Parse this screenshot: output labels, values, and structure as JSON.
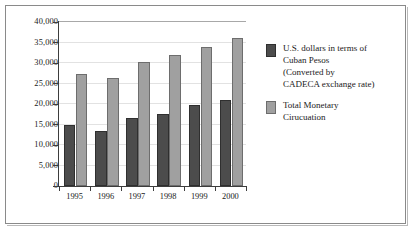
{
  "chart_data": {
    "type": "bar",
    "title": "",
    "subtitle": "",
    "xlabel": "",
    "ylabel": "",
    "categories": [
      "1995",
      "1996",
      "1997",
      "1998",
      "1999",
      "2000"
    ],
    "series": [
      {
        "name": "U.S. dollars in terms of Cuban Pesos (Converted by CADECA exchange rate)",
        "color": "#4c4c4c",
        "values": [
          14800,
          13300,
          16700,
          17600,
          19700,
          21000
        ]
      },
      {
        "name": "Total Monetary Cirucuation",
        "color": "#a0a0a0",
        "values": [
          27300,
          26400,
          30300,
          32000,
          33900,
          36200
        ]
      }
    ],
    "ylim": [
      0,
      40000
    ],
    "ytick_values": [
      0,
      5000,
      10000,
      15000,
      20000,
      25000,
      30000,
      35000,
      40000
    ],
    "ytick_labels": [
      "0",
      "5,000",
      "10,000",
      "15,000",
      "20,000",
      "25,000",
      "30,000",
      "35,000",
      "40,000"
    ],
    "grid": true,
    "legend_position": "right"
  },
  "legend": {
    "entries": [
      {
        "swatch": "dark-gray-swatch",
        "lines": [
          "U.S. dollars in terms of",
          "Cuban Pesos",
          "(Converted by",
          "CADECA exchange rate)"
        ]
      },
      {
        "swatch": "light-gray-swatch",
        "lines": [
          "Total Monetary",
          "Cirucuation"
        ]
      }
    ]
  }
}
